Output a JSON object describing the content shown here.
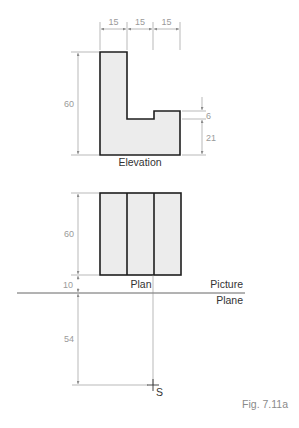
{
  "figure": {
    "caption": "Fig. 7.11a",
    "colors": {
      "outline": "#1e1e1e",
      "fill": "#ececec",
      "dimension": "#8a8a8a",
      "dimension_text": "#9a9a9a",
      "label_text": "#333333"
    }
  },
  "elevation": {
    "label": "Elevation",
    "dims": {
      "top_widths": [
        "15",
        "15",
        "15"
      ],
      "height": "60",
      "step_depth": "6",
      "step_height": "21"
    }
  },
  "plan": {
    "label": "Plan",
    "dims": {
      "depth": "60",
      "offset_to_picture_plane": "10"
    }
  },
  "picture_plane": {
    "label_line1": "Picture",
    "label_line2": "Plane"
  },
  "station_point": {
    "label": "S",
    "distance": "54"
  }
}
